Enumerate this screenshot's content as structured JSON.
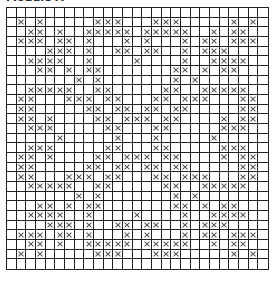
{
  "title": "Module A",
  "chart_data": {
    "type": "grid-pattern",
    "title": "Module A",
    "rows": 27,
    "cols": 27,
    "mark": "X",
    "marked_cells_by_row": [
      [],
      [
        1,
        3,
        9,
        10,
        11,
        15,
        16,
        17,
        23,
        25
      ],
      [
        2,
        3,
        5,
        8,
        9,
        10,
        11,
        12,
        14,
        15,
        16,
        17,
        18,
        21,
        23,
        24
      ],
      [
        1,
        2,
        3,
        5,
        6,
        8,
        12,
        14,
        18,
        20,
        21,
        23,
        24,
        25
      ],
      [
        4,
        5,
        6,
        8,
        11,
        12,
        14,
        15,
        18,
        20,
        21,
        22
      ],
      [
        2,
        3,
        4,
        5,
        8,
        13,
        18,
        21,
        22,
        23,
        24
      ],
      [
        3,
        4,
        6,
        8,
        9,
        17,
        18,
        20,
        22,
        23
      ],
      [
        7,
        9,
        17,
        19
      ],
      [
        2,
        3,
        4,
        5,
        6,
        9,
        10,
        16,
        17,
        20,
        21,
        22,
        23,
        24
      ],
      [
        1,
        2,
        6,
        7,
        8,
        10,
        11,
        15,
        16,
        18,
        19,
        20,
        24,
        25
      ],
      [
        1,
        2,
        8,
        9,
        11,
        12,
        14,
        15,
        17,
        18,
        24,
        25
      ],
      [
        1,
        2,
        4,
        9,
        10,
        12,
        13,
        14,
        16,
        17,
        22,
        24,
        25
      ],
      [
        2,
        3,
        4,
        10,
        11,
        15,
        16,
        22,
        23,
        24
      ],
      [
        5,
        11,
        15,
        21
      ],
      [
        2,
        3,
        4,
        10,
        11,
        15,
        16,
        22,
        23,
        24
      ],
      [
        1,
        2,
        4,
        9,
        10,
        12,
        13,
        14,
        16,
        17,
        22,
        24,
        25
      ],
      [
        1,
        2,
        8,
        9,
        11,
        12,
        14,
        15,
        17,
        18,
        24,
        25
      ],
      [
        1,
        2,
        6,
        7,
        8,
        10,
        11,
        15,
        16,
        18,
        19,
        20,
        24,
        25
      ],
      [
        2,
        3,
        4,
        5,
        6,
        9,
        10,
        16,
        17,
        20,
        21,
        22,
        23,
        24
      ],
      [
        7,
        9,
        17,
        19
      ],
      [
        3,
        4,
        6,
        8,
        9,
        17,
        18,
        20,
        22,
        23
      ],
      [
        2,
        3,
        4,
        5,
        8,
        13,
        18,
        21,
        22,
        23,
        24
      ],
      [
        4,
        5,
        6,
        8,
        11,
        12,
        14,
        15,
        18,
        20,
        21,
        22
      ],
      [
        1,
        2,
        3,
        5,
        6,
        8,
        12,
        14,
        18,
        20,
        21,
        23,
        24,
        25
      ],
      [
        2,
        3,
        5,
        8,
        9,
        10,
        11,
        12,
        14,
        15,
        16,
        17,
        18,
        21,
        23,
        24
      ],
      [
        1,
        3,
        9,
        10,
        11,
        15,
        16,
        17,
        23,
        25
      ],
      []
    ]
  }
}
